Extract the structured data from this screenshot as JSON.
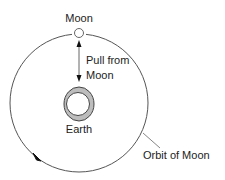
{
  "diagram": {
    "labels": {
      "moon": "Moon",
      "pull_line1": "Pull from",
      "pull_line2": "Moon",
      "earth": "Earth",
      "orbit": "Orbit of Moon"
    },
    "colors": {
      "line": "#555555",
      "earth_ring": "#bdbdbd",
      "text": "#222222",
      "background": "#ffffff"
    },
    "elements": {
      "orbit": {
        "cx": 79,
        "cy": 103,
        "r": 69
      },
      "moon": {
        "cx": 79,
        "cy": 33,
        "r": 5
      },
      "earth": {
        "cx": 79,
        "cy": 104,
        "outer_rx": 15,
        "outer_ry": 17,
        "inner_r": 12
      },
      "pull_arrow": {
        "x": 79,
        "y1": 40,
        "y2": 82,
        "direction": "bidirectional"
      },
      "orbit_direction": "counterclockwise"
    }
  }
}
